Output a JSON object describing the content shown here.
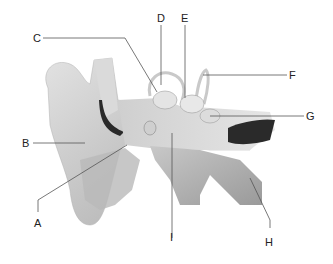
{
  "diagram": {
    "labels": [
      {
        "id": "A",
        "text": "A"
      },
      {
        "id": "B",
        "text": "B"
      },
      {
        "id": "C",
        "text": "C"
      },
      {
        "id": "D",
        "text": "D"
      },
      {
        "id": "E",
        "text": "E"
      },
      {
        "id": "F",
        "text": "F"
      },
      {
        "id": "G",
        "text": "G"
      },
      {
        "id": "H",
        "text": "H"
      },
      {
        "id": "I",
        "text": "I"
      }
    ],
    "colors": {
      "background": "#ffffff",
      "tissue_light": "#d8d8d8",
      "tissue_mid": "#b5b5b5",
      "tissue_dark": "#8c8c8c",
      "canal_dark": "#2a2a2a",
      "leader_line": "#555555",
      "label_text": "#222222"
    }
  }
}
